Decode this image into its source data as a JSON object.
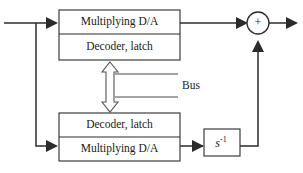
{
  "diagram": {
    "colors": {
      "stroke": "#2b2b2b",
      "bus_stroke": "#555555",
      "background": "#ffffff"
    },
    "top_block": {
      "name": "top-converter-block",
      "rows": [
        {
          "label": "Multiplying D/A"
        },
        {
          "label": "Decoder, latch"
        }
      ]
    },
    "bottom_block": {
      "name": "bottom-converter-block",
      "rows": [
        {
          "label": "Decoder, latch"
        },
        {
          "label": "Multiplying D/A"
        }
      ]
    },
    "integrator": {
      "base": "s",
      "exponent": "-1",
      "label": "s-1"
    },
    "summing_junction": {
      "sign": "+"
    },
    "bus": {
      "label": "Bus"
    },
    "icons": {
      "input_arrow": "arrow-right-icon",
      "output_arrow": "arrow-right-icon",
      "feedback_arrow": "arrow-up-icon",
      "bus_double_arrow": "double-arrow-vertical-icon"
    }
  }
}
